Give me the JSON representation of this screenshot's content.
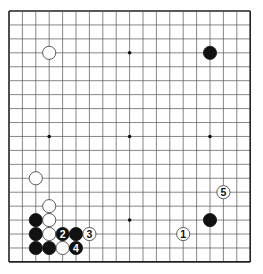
{
  "board": {
    "size": 19,
    "left": 9,
    "top": 11,
    "dx": 13.4,
    "dy": 13.94,
    "line_color": "#555555",
    "border_color": "#222222",
    "background": "#ffffff"
  },
  "star_points": [
    [
      3,
      3
    ],
    [
      9,
      3
    ],
    [
      15,
      3
    ],
    [
      3,
      9
    ],
    [
      9,
      9
    ],
    [
      15,
      9
    ],
    [
      3,
      15
    ],
    [
      9,
      15
    ],
    [
      15,
      15
    ]
  ],
  "stones": [
    {
      "col": 3,
      "row": 3,
      "color": "white",
      "label": ""
    },
    {
      "col": 15,
      "row": 3,
      "color": "black",
      "label": ""
    },
    {
      "col": 2,
      "row": 12,
      "color": "white",
      "label": ""
    },
    {
      "col": 3,
      "row": 14,
      "color": "white",
      "label": ""
    },
    {
      "col": 2,
      "row": 15,
      "color": "black",
      "label": ""
    },
    {
      "col": 3,
      "row": 15,
      "color": "white",
      "label": ""
    },
    {
      "col": 2,
      "row": 16,
      "color": "black",
      "label": ""
    },
    {
      "col": 3,
      "row": 16,
      "color": "white",
      "label": ""
    },
    {
      "col": 4,
      "row": 16,
      "color": "black",
      "label": "2"
    },
    {
      "col": 5,
      "row": 16,
      "color": "black",
      "label": ""
    },
    {
      "col": 6,
      "row": 16,
      "color": "white",
      "label": "3"
    },
    {
      "col": 2,
      "row": 17,
      "color": "black",
      "label": ""
    },
    {
      "col": 3,
      "row": 17,
      "color": "black",
      "label": ""
    },
    {
      "col": 4,
      "row": 17,
      "color": "white",
      "label": ""
    },
    {
      "col": 5,
      "row": 17,
      "color": "black",
      "label": "4"
    },
    {
      "col": 16,
      "row": 13,
      "color": "white",
      "label": "5"
    },
    {
      "col": 15,
      "row": 15,
      "color": "black",
      "label": ""
    },
    {
      "col": 13,
      "row": 16,
      "color": "white",
      "label": "1"
    }
  ]
}
